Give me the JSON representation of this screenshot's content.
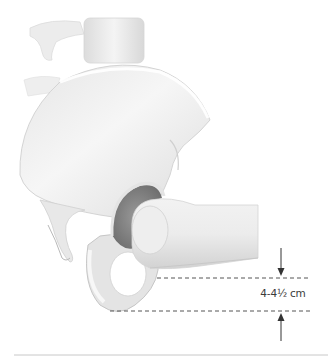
{
  "figure": {
    "measurement": {
      "label": "4-4½ cm",
      "arrow_top": "down-arrow",
      "arrow_bottom": "up-arrow"
    },
    "colors": {
      "bone_light": "#f7f7f7",
      "bone_mid": "#e2e2e2",
      "bone_shadow": "#bdbdbd",
      "bone_dark": "#8a8a8a",
      "dash_line": "#555555",
      "arrow": "#333333",
      "baseline": "#c8c8c8",
      "text": "#3a3a3a"
    }
  }
}
